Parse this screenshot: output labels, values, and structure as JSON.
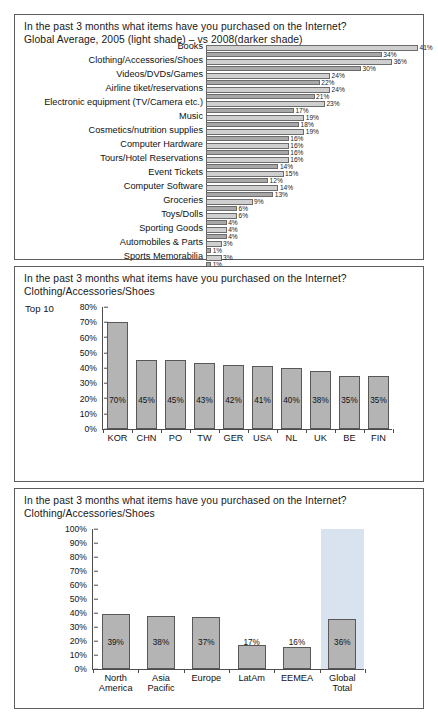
{
  "panels": [
    {
      "name": "panel-internet-purchases-global",
      "title_line1": "In the past 3 months what items have you purchased on the Internet?",
      "title_line2": "Global Average, 2005 (light shade) – vs 2008(darker shade)"
    },
    {
      "name": "panel-clothing-top10",
      "title_line1": "In the past 3 months what items have you purchased on the Internet?",
      "title_line2": "Clothing/Accessories/Shoes",
      "subtitle": "Top 10"
    },
    {
      "name": "panel-clothing-regions",
      "title_line1": "In the past 3 months what items have you purchased on the Internet?",
      "title_line2": "Clothing/Accessories/Shoes"
    }
  ],
  "footer": "",
  "colors": {
    "bar_light": "#cfcfcf",
    "bar_dark": "#a8a8a8",
    "bar_vertical": "#b4b4b4",
    "bar_stroke": "#585858",
    "highlight_band": "#d9e2ef",
    "panel_border": "#5d5d5d"
  },
  "chart_data": [
    {
      "type": "bar",
      "orientation": "horizontal",
      "title": "In the past 3 months what items have you purchased on the Internet?",
      "subtitle": "Global Average, 2005 (light shade) – vs 2008(darker shade)",
      "xlabel": "",
      "ylabel": "",
      "xlim": [
        0,
        41
      ],
      "grid": false,
      "legend": [
        "2005 (light shade)",
        "2008 (darker shade)"
      ],
      "legend_position": "in-subtitle",
      "categories": [
        "Books",
        "Clothing/Accessories/Shoes",
        "Videos/DVDs/Games",
        "Airline tiket/reservations",
        "Electronic equipment (TV/Camera etc.)",
        "Music",
        "Cosmetics/nutrition supplies",
        "Computer Hardware",
        "Tours/Hotel Reservations",
        "Event Tickets",
        "Computer Software",
        "Groceries",
        "Toys/Dolls",
        "Sporting Goods",
        "Automobiles & Parts",
        "Sports Memorabilia",
        "Other"
      ],
      "series": [
        {
          "name": "2005",
          "shade": "light",
          "values": [
            41,
            36,
            24,
            24,
            23,
            19,
            19,
            16,
            16,
            15,
            14,
            9,
            6,
            4,
            3,
            3,
            20
          ],
          "labels": [
            "41%",
            "36%",
            "24%",
            "24%",
            "23%",
            "19%",
            "19%",
            "16%",
            "16%",
            "15%",
            "14%",
            "9%",
            "6%",
            "4%",
            "3%",
            "3%",
            "20%"
          ]
        },
        {
          "name": "2008",
          "shade": "dark",
          "values": [
            34,
            30,
            22,
            21,
            17,
            18,
            16,
            16,
            14,
            12,
            13,
            6,
            4,
            4,
            1,
            1,
            19
          ],
          "labels": [
            "34%",
            "30%",
            "22%",
            "21%",
            "17%",
            "18%",
            "16%",
            "16%",
            "14%",
            "12%",
            "13%",
            "6%",
            "4%",
            "4%",
            "1%",
            "1%",
            "19%"
          ]
        }
      ]
    },
    {
      "type": "bar",
      "orientation": "vertical",
      "title": "In the past 3 months what items have you purchased on the Internet?",
      "subtitle": "Clothing/Accessories/Shoes",
      "note": "Top 10",
      "xlabel": "",
      "ylabel": "",
      "ylim": [
        0,
        80
      ],
      "grid": false,
      "yticks": [
        "0%",
        "10%",
        "20%",
        "30%",
        "40%",
        "50%",
        "60%",
        "70%",
        "80%"
      ],
      "categories": [
        "KOR",
        "CHN",
        "PO",
        "TW",
        "GER",
        "USA",
        "NL",
        "UK",
        "BE",
        "FIN"
      ],
      "values": [
        70,
        45,
        45,
        43,
        42,
        41,
        40,
        38,
        35,
        35
      ],
      "value_labels": [
        "70%",
        "45%",
        "45%",
        "43%",
        "42%",
        "41%",
        "40%",
        "38%",
        "35%",
        "35%"
      ]
    },
    {
      "type": "bar",
      "orientation": "vertical",
      "title": "In the past 3 months what items have you purchased on the Internet?",
      "subtitle": "Clothing/Accessories/Shoes",
      "xlabel": "",
      "ylabel": "",
      "ylim": [
        0,
        100
      ],
      "grid": false,
      "yticks": [
        "0%",
        "10%",
        "20%",
        "30%",
        "40%",
        "50%",
        "60%",
        "70%",
        "80%",
        "90%",
        "100%"
      ],
      "categories": [
        "North America",
        "Asia Pacific",
        "Europe",
        "LatAm",
        "EEMEA",
        "Global Total"
      ],
      "category_lines": [
        [
          "North",
          "America"
        ],
        [
          "Asia",
          "Pacific"
        ],
        [
          "Europe"
        ],
        [
          "LatAm"
        ],
        [
          "EEMEA"
        ],
        [
          "Global",
          "Total"
        ]
      ],
      "values": [
        39,
        38,
        37,
        17,
        16,
        36
      ],
      "value_labels": [
        "39%",
        "38%",
        "37%",
        "17%",
        "16%",
        "36%"
      ],
      "highlighted_category": "Global Total"
    }
  ]
}
